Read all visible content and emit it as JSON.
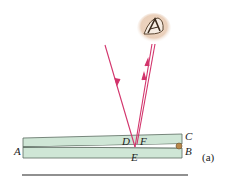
{
  "figure": {
    "caption": "(a)",
    "labels": {
      "A": "A",
      "B": "B",
      "C": "C",
      "D": "D",
      "E": "E",
      "F": "F"
    },
    "colors": {
      "plate_fill": "#cfe6d6",
      "plate_stroke": "#5a6b60",
      "ray": "#d2336b",
      "spacer": "#b8894a",
      "baseline": "#222222"
    }
  }
}
